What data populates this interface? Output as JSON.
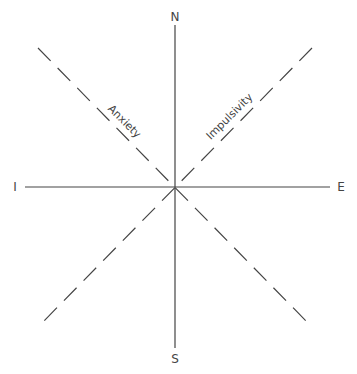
{
  "diagram": {
    "type": "personality-axes",
    "axes": {
      "north": "N",
      "south": "S",
      "west": "I",
      "east": "E"
    },
    "diagonals": [
      {
        "label": "Anxiety",
        "direction": "NW-SE",
        "style": "dashed"
      },
      {
        "label": "Impulsivity",
        "direction": "NE-SW",
        "style": "dashed"
      }
    ],
    "colors": {
      "line": "#444444",
      "background": "#ffffff"
    }
  }
}
